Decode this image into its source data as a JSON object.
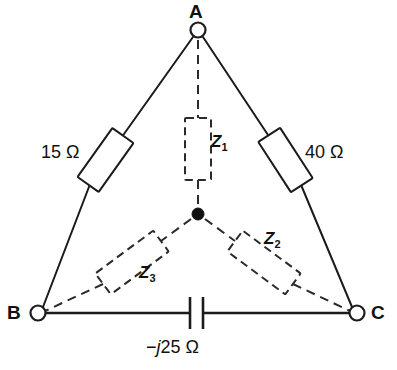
{
  "figure": {
    "background_color": "#ffffff",
    "line_color": "#1b1b1b"
  },
  "terminals": [
    {
      "id": "A",
      "label": "A",
      "type": "open-circle",
      "position": "top"
    },
    {
      "id": "B",
      "label": "B",
      "type": "open-circle",
      "position": "bottom-left"
    },
    {
      "id": "C",
      "label": "C",
      "type": "open-circle",
      "position": "bottom-right"
    }
  ],
  "center_node": {
    "label": "",
    "type": "filled-dot"
  },
  "delta_branches": [
    {
      "id": "ab",
      "between": "A-B",
      "component": "resistor",
      "value_label": "15 Ω",
      "style": "solid"
    },
    {
      "id": "ac",
      "between": "A-C",
      "component": "resistor",
      "value_label": "40 Ω",
      "style": "solid"
    },
    {
      "id": "bc",
      "between": "B-C",
      "component": "capacitor",
      "value_prefix": "−",
      "value_j": "j",
      "value_suffix": "25 Ω",
      "value_label": "−j25 Ω",
      "style": "solid"
    }
  ],
  "wye_branches": [
    {
      "id": "z1",
      "from": "A",
      "to": "center",
      "component": "impedance",
      "label_base": "Z",
      "label_sub": "1",
      "label_full": "Z1",
      "style": "dashed"
    },
    {
      "id": "z2",
      "from": "center",
      "to": "C",
      "component": "impedance",
      "label_base": "Z",
      "label_sub": "2",
      "label_full": "Z2",
      "style": "dashed"
    },
    {
      "id": "z3",
      "from": "center",
      "to": "B",
      "component": "impedance",
      "label_base": "Z",
      "label_sub": "3",
      "label_full": "Z3",
      "style": "dashed"
    }
  ]
}
